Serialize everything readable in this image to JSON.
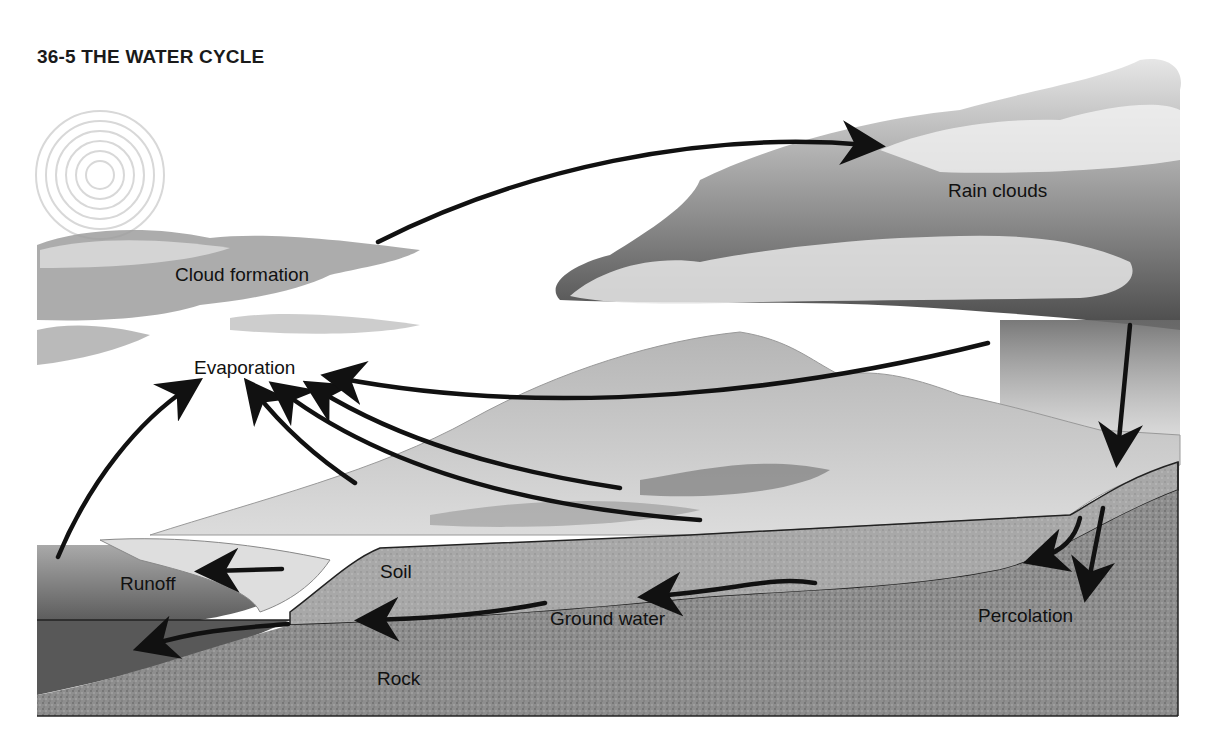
{
  "figure": {
    "title": "36-5 THE WATER CYCLE"
  },
  "labels": {
    "cloud_formation": "Cloud formation",
    "rain_clouds": "Rain clouds",
    "evaporation": "Evaporation",
    "runoff": "Runoff",
    "soil": "Soil",
    "ground_water": "Ground water",
    "percolation": "Percolation",
    "rock": "Rock"
  },
  "processes": [
    {
      "from": "Cloud formation",
      "to": "Rain clouds",
      "direction": "right"
    },
    {
      "from": "Rain clouds",
      "to": "Percolation",
      "direction": "down"
    },
    {
      "from": "Ground water",
      "to": "Runoff",
      "direction": "left"
    },
    {
      "from": "Ocean",
      "to": "Evaporation",
      "direction": "up"
    },
    {
      "from": "Land",
      "to": "Evaporation",
      "direction": "up-left"
    }
  ],
  "colors": {
    "arrow": "#111111",
    "sky": "#ffffff",
    "soil": "#9a9a9a",
    "rock": "#7d7d7d",
    "water": "#8c8c8c"
  }
}
